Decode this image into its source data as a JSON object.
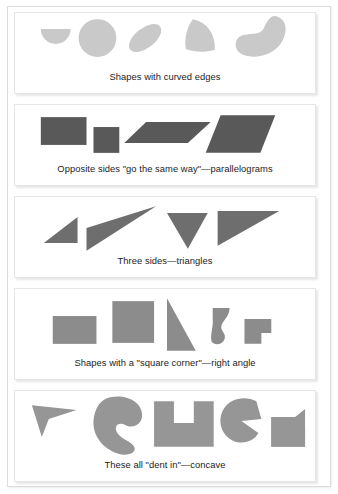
{
  "page": {
    "background_color": "#ffffff",
    "frame_color": "#dcdcdc"
  },
  "panels": [
    {
      "id": "curved-edges",
      "caption": "Shapes with curved edges",
      "shape_fill": "#c9c9c9",
      "shape_count": 5,
      "shapes": [
        {
          "name": "semicircle",
          "label": "semicircle"
        },
        {
          "name": "circle",
          "label": "circle"
        },
        {
          "name": "tilted-ellipse",
          "label": "tilted ellipse"
        },
        {
          "name": "curved-wedge",
          "label": "curved wedge"
        },
        {
          "name": "crescent-bean",
          "label": "crescent bean"
        }
      ]
    },
    {
      "id": "parallelograms",
      "caption": "Opposite sides \"go the same way\"—parallelograms",
      "shape_fill": "#595959",
      "shape_count": 4,
      "shapes": [
        {
          "name": "rectangle",
          "label": "rectangle"
        },
        {
          "name": "square",
          "label": "square"
        },
        {
          "name": "flat-parallelogram",
          "label": "flat parallelogram"
        },
        {
          "name": "slanted-parallelogram",
          "label": "slanted parallelogram"
        }
      ]
    },
    {
      "id": "triangles",
      "caption": "Three sides—triangles",
      "shape_fill": "#6e6e6e",
      "shape_count": 4,
      "shapes": [
        {
          "name": "small-right-triangle",
          "label": "small right triangle"
        },
        {
          "name": "long-thin-triangle",
          "label": "long thin triangle"
        },
        {
          "name": "downward-triangle",
          "label": "downward triangle"
        },
        {
          "name": "wide-scalene-triangle",
          "label": "wide scalene triangle"
        }
      ]
    },
    {
      "id": "right-angle",
      "caption": "Shapes with a \"square corner\"—right angle",
      "shape_fill": "#8c8c8c",
      "shape_count": 5,
      "shapes": [
        {
          "name": "rectangle",
          "label": "rectangle"
        },
        {
          "name": "square",
          "label": "square"
        },
        {
          "name": "right-triangle",
          "label": "right triangle"
        },
        {
          "name": "curved-corner-blob",
          "label": "curved blob with square corner"
        },
        {
          "name": "l-shape",
          "label": "L shape"
        }
      ]
    },
    {
      "id": "concave",
      "caption": "These all \"dent in\"—concave",
      "shape_fill": "#969696",
      "shape_count": 5,
      "shapes": [
        {
          "name": "dart-arrowhead",
          "label": "dart arrowhead"
        },
        {
          "name": "curved-c-blob",
          "label": "curved C blob"
        },
        {
          "name": "u-shape",
          "label": "U shape"
        },
        {
          "name": "pacman-c",
          "label": "Pac-Man C shape"
        },
        {
          "name": "notched-block",
          "label": "notched block"
        }
      ]
    }
  ]
}
